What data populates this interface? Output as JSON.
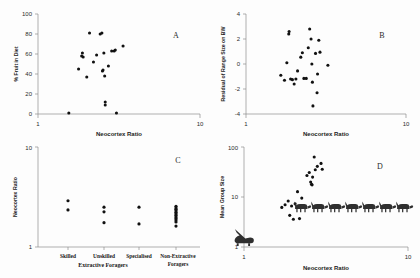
{
  "figure": {
    "title": "",
    "panels": [
      "A",
      "B",
      "C",
      "D"
    ]
  },
  "panel_a": {
    "letter": "A",
    "xlabel": "Neocortex Ratio",
    "ylabel": "% Fruit in Diet",
    "xticks": [
      "1",
      "10"
    ],
    "yticks": [
      "0",
      "20",
      "40",
      "60",
      "80",
      "100"
    ]
  },
  "panel_b": {
    "letter": "B",
    "xlabel": "Neocortex Ratio",
    "ylabel": "Residual of Range Size on BW",
    "xticks": [
      "1",
      "10"
    ],
    "yticks": [
      "-4",
      "-2",
      "0",
      "2",
      "4"
    ]
  },
  "panel_c": {
    "letter": "C",
    "ylabel": "Neocortex Ratio",
    "yticks": [
      "1",
      "10"
    ],
    "categories": [
      "Skilled",
      "Unskilled",
      "Specialised",
      "Non-Extractive Foragers"
    ],
    "group_label": "Extractive Foragers"
  },
  "panel_d": {
    "letter": "D",
    "xlabel": "Neocortex Ratio",
    "ylabel": "Mean Group Size",
    "xticks": [
      "1",
      "10"
    ],
    "yticks": [
      "1",
      "10",
      "100"
    ],
    "icons": [
      "monkey-silhouette",
      "prosimian-silhouette"
    ]
  },
  "chart_data": [
    {
      "type": "scatter",
      "panel": "A",
      "title": "",
      "xlabel": "Neocortex Ratio",
      "ylabel": "% Fruit in Diet",
      "xscale": "log",
      "xlim": [
        1,
        10
      ],
      "ylim": [
        0,
        100
      ],
      "xtick_values": [
        1,
        10
      ],
      "ytick_values": [
        0,
        20,
        40,
        60,
        80,
        100
      ],
      "grid": false,
      "legend": "none",
      "points": [
        {
          "x": 1.55,
          "y": 1
        },
        {
          "x": 1.78,
          "y": 45
        },
        {
          "x": 1.86,
          "y": 58
        },
        {
          "x": 1.88,
          "y": 61
        },
        {
          "x": 1.9,
          "y": 57
        },
        {
          "x": 2.0,
          "y": 37
        },
        {
          "x": 2.08,
          "y": 81
        },
        {
          "x": 2.2,
          "y": 52
        },
        {
          "x": 2.3,
          "y": 59
        },
        {
          "x": 2.42,
          "y": 80
        },
        {
          "x": 2.48,
          "y": 81
        },
        {
          "x": 2.5,
          "y": 43
        },
        {
          "x": 2.52,
          "y": 44
        },
        {
          "x": 2.55,
          "y": 61
        },
        {
          "x": 2.58,
          "y": 38
        },
        {
          "x": 2.6,
          "y": 12
        },
        {
          "x": 2.6,
          "y": 9
        },
        {
          "x": 2.72,
          "y": 48
        },
        {
          "x": 2.85,
          "y": 63
        },
        {
          "x": 2.95,
          "y": 63
        },
        {
          "x": 3.0,
          "y": 64
        },
        {
          "x": 3.05,
          "y": 1
        },
        {
          "x": 3.35,
          "y": 68
        }
      ]
    },
    {
      "type": "scatter",
      "panel": "B",
      "title": "",
      "xlabel": "Neocortex Ratio",
      "ylabel": "Residual of Range Size on BW",
      "xscale": "log",
      "xlim": [
        1,
        10
      ],
      "ylim": [
        -4,
        4
      ],
      "xtick_values": [
        1,
        10
      ],
      "ytick_values": [
        -4,
        -2,
        0,
        2,
        4
      ],
      "grid": false,
      "legend": "none",
      "points": [
        {
          "x": 1.65,
          "y": -0.9
        },
        {
          "x": 1.74,
          "y": -1.3
        },
        {
          "x": 1.8,
          "y": 0.1
        },
        {
          "x": 1.85,
          "y": 2.4
        },
        {
          "x": 1.86,
          "y": 2.6
        },
        {
          "x": 1.9,
          "y": -1.2
        },
        {
          "x": 1.95,
          "y": -1.25
        },
        {
          "x": 2.0,
          "y": -1.6
        },
        {
          "x": 2.05,
          "y": -1.2
        },
        {
          "x": 2.1,
          "y": -0.55
        },
        {
          "x": 2.2,
          "y": 0.55
        },
        {
          "x": 2.25,
          "y": 0.9
        },
        {
          "x": 2.3,
          "y": -1.15
        },
        {
          "x": 2.38,
          "y": -1.15
        },
        {
          "x": 2.45,
          "y": 1.3
        },
        {
          "x": 2.5,
          "y": 2.8
        },
        {
          "x": 2.55,
          "y": 2.0
        },
        {
          "x": 2.58,
          "y": 0.0
        },
        {
          "x": 2.6,
          "y": -1.45
        },
        {
          "x": 2.62,
          "y": -3.35
        },
        {
          "x": 2.72,
          "y": 0.85
        },
        {
          "x": 2.78,
          "y": -2.3
        },
        {
          "x": 2.8,
          "y": -0.8
        },
        {
          "x": 2.85,
          "y": 1.9
        },
        {
          "x": 2.9,
          "y": 0.95
        },
        {
          "x": 3.25,
          "y": -0.1
        }
      ]
    },
    {
      "type": "scatter",
      "panel": "C",
      "title": "",
      "xlabel": "",
      "ylabel": "Neocortex Ratio",
      "yscale": "log",
      "ylim": [
        1,
        10
      ],
      "ytick_values": [
        1,
        10
      ],
      "grid": false,
      "legend": "none",
      "categories": [
        "Skilled",
        "Unskilled",
        "Specialised",
        "Non-Extractive Foragers"
      ],
      "series": [
        {
          "name": "Skilled",
          "values": [
            2.9,
            2.35
          ]
        },
        {
          "name": "Unskilled",
          "values": [
            2.5,
            2.25,
            1.75
          ]
        },
        {
          "name": "Specialised",
          "values": [
            2.5,
            1.7
          ]
        },
        {
          "name": "Non-Extractive Foragers",
          "values": [
            2.55,
            2.45,
            2.38,
            2.3,
            2.22,
            2.15,
            2.08,
            2.0,
            1.93,
            1.86,
            1.78,
            1.62
          ]
        }
      ]
    },
    {
      "type": "scatter",
      "panel": "D",
      "title": "",
      "xlabel": "Neocortex Ratio",
      "ylabel": "Mean Group Size",
      "xscale": "log",
      "yscale": "log",
      "xlim": [
        1,
        10
      ],
      "ylim": [
        1,
        100
      ],
      "xtick_values": [
        1,
        10
      ],
      "ytick_values": [
        1,
        10,
        100
      ],
      "grid": false,
      "legend": "none",
      "points": [
        {
          "x": 1.7,
          "y": 6.2
        },
        {
          "x": 1.78,
          "y": 7.0
        },
        {
          "x": 1.86,
          "y": 8.3
        },
        {
          "x": 1.9,
          "y": 4.3
        },
        {
          "x": 1.95,
          "y": 6.6
        },
        {
          "x": 2.0,
          "y": 3.6
        },
        {
          "x": 2.05,
          "y": 7.3
        },
        {
          "x": 2.12,
          "y": 12.8
        },
        {
          "x": 2.18,
          "y": 3.7
        },
        {
          "x": 2.25,
          "y": 9.5
        },
        {
          "x": 2.42,
          "y": 27.0
        },
        {
          "x": 2.5,
          "y": 31.0
        },
        {
          "x": 2.55,
          "y": 20.0
        },
        {
          "x": 2.58,
          "y": 18.0
        },
        {
          "x": 2.6,
          "y": 17.5
        },
        {
          "x": 2.62,
          "y": 25.0
        },
        {
          "x": 2.68,
          "y": 63.0
        },
        {
          "x": 2.72,
          "y": 35.0
        },
        {
          "x": 2.8,
          "y": 41.0
        },
        {
          "x": 2.95,
          "y": 47.0
        },
        {
          "x": 3.0,
          "y": 36.0
        }
      ]
    }
  ]
}
